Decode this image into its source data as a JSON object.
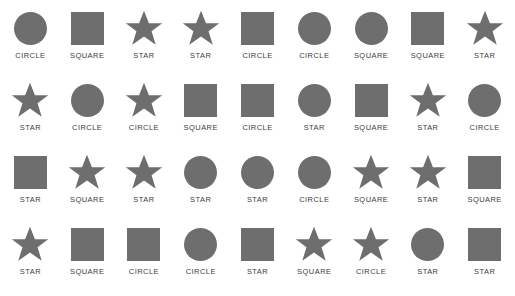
{
  "page": {
    "shape_fill_color": "#6e6e6e",
    "label_color": "#3c3c3c",
    "background_color": "#ffffff",
    "columns": 9,
    "rows": 4
  },
  "icon_names": {
    "circle": "circle-icon",
    "square": "square-icon",
    "star": "star-icon"
  },
  "grid": {
    "rows": [
      {
        "cells": [
          {
            "shape": "circle",
            "label": "CIRCLE"
          },
          {
            "shape": "square",
            "label": "SQUARE"
          },
          {
            "shape": "star",
            "label": "STAR"
          },
          {
            "shape": "star",
            "label": "STAR"
          },
          {
            "shape": "square",
            "label": "CIRCLE"
          },
          {
            "shape": "circle",
            "label": "CIRCLE"
          },
          {
            "shape": "circle",
            "label": "SQUARE"
          },
          {
            "shape": "square",
            "label": "SQUARE"
          },
          {
            "shape": "star",
            "label": "STAR"
          }
        ]
      },
      {
        "cells": [
          {
            "shape": "star",
            "label": "STAR"
          },
          {
            "shape": "circle",
            "label": "CIRCLE"
          },
          {
            "shape": "star",
            "label": "CIRCLE"
          },
          {
            "shape": "square",
            "label": "SQUARE"
          },
          {
            "shape": "square",
            "label": "CIRCLE"
          },
          {
            "shape": "circle",
            "label": "STAR"
          },
          {
            "shape": "square",
            "label": "SQUARE"
          },
          {
            "shape": "star",
            "label": "STAR"
          },
          {
            "shape": "circle",
            "label": "CIRCLE"
          }
        ]
      },
      {
        "cells": [
          {
            "shape": "square",
            "label": "STAR"
          },
          {
            "shape": "star",
            "label": "SQUARE"
          },
          {
            "shape": "star",
            "label": "STAR"
          },
          {
            "shape": "circle",
            "label": "STAR"
          },
          {
            "shape": "circle",
            "label": "STAR"
          },
          {
            "shape": "circle",
            "label": "CIRCLE"
          },
          {
            "shape": "star",
            "label": "SQUARE"
          },
          {
            "shape": "star",
            "label": "STAR"
          },
          {
            "shape": "square",
            "label": "SQUARE"
          }
        ]
      },
      {
        "cells": [
          {
            "shape": "star",
            "label": "STAR"
          },
          {
            "shape": "square",
            "label": "SQUARE"
          },
          {
            "shape": "square",
            "label": "CIRCLE"
          },
          {
            "shape": "circle",
            "label": "CIRCLE"
          },
          {
            "shape": "square",
            "label": "STAR"
          },
          {
            "shape": "star",
            "label": "SQUARE"
          },
          {
            "shape": "star",
            "label": "CIRCLE"
          },
          {
            "shape": "circle",
            "label": "STAR"
          },
          {
            "shape": "square",
            "label": "STAR"
          }
        ]
      }
    ]
  }
}
